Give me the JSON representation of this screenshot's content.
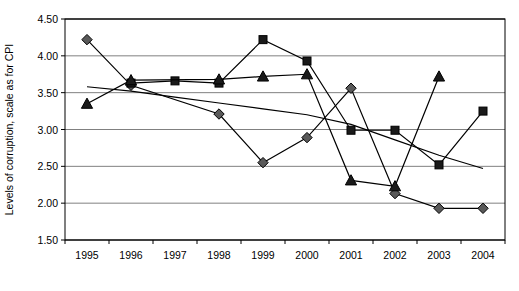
{
  "chart_data": {
    "type": "line",
    "title": "",
    "xlabel": "",
    "ylabel": "Levels of corruption, scale as for CPI",
    "categories": [
      "1995",
      "1996",
      "1997",
      "1998",
      "1999",
      "2000",
      "2001",
      "2002",
      "2003",
      "2004"
    ],
    "ylim": [
      1.5,
      4.5
    ],
    "ytick_labels": [
      "4.50",
      "4.00",
      "3.50",
      "3.00",
      "2.50",
      "2.00",
      "1.50"
    ],
    "yticks": [
      4.5,
      4.0,
      3.5,
      3.0,
      2.5,
      2.0,
      1.5
    ],
    "grid": true,
    "legend": "none",
    "series": [
      {
        "name": "series-diamond",
        "marker": "diamond",
        "marker_color": "#595959",
        "line_color": "#000000",
        "values": [
          4.22,
          3.6,
          null,
          3.21,
          2.55,
          2.89,
          3.56,
          2.13,
          1.93,
          1.93
        ]
      },
      {
        "name": "series-square",
        "marker": "square",
        "marker_color": "#1a1a1a",
        "line_color": "#000000",
        "values": [
          null,
          3.63,
          3.66,
          3.63,
          4.22,
          3.93,
          2.99,
          2.99,
          2.52,
          3.25
        ]
      },
      {
        "name": "series-triangle",
        "marker": "triangle",
        "marker_color": "#1a1a1a",
        "line_color": "#000000",
        "values": [
          3.35,
          3.67,
          null,
          3.68,
          3.72,
          3.75,
          2.31,
          2.23,
          3.72,
          null
        ]
      },
      {
        "name": "series-trend-line",
        "marker": "none",
        "marker_color": "#000000",
        "line_color": "#000000",
        "values": [
          3.58,
          3.52,
          3.44,
          3.36,
          3.28,
          3.2,
          3.07,
          2.86,
          2.65,
          2.47
        ]
      }
    ],
    "axis_color": "#000000",
    "grid_color": "#808080",
    "background": "#ffffff"
  }
}
